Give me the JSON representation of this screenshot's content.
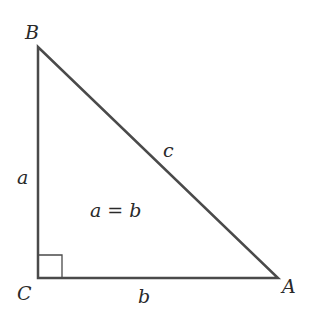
{
  "diagram": {
    "type": "right-triangle",
    "colors": {
      "stroke": "#4a4a4a",
      "text": "#2a2a2a",
      "background": "#ffffff"
    },
    "vertices": [
      {
        "name": "B",
        "x": 38,
        "y": 47
      },
      {
        "name": "C",
        "x": 38,
        "y": 278
      },
      {
        "name": "A",
        "x": 278,
        "y": 278
      }
    ],
    "labels": {
      "vertex_b": "B",
      "vertex_c": "C",
      "vertex_a": "A",
      "side_a": "a",
      "side_b": "b",
      "side_c": "c",
      "relation": "a = b"
    },
    "right_angle_at": "C"
  }
}
